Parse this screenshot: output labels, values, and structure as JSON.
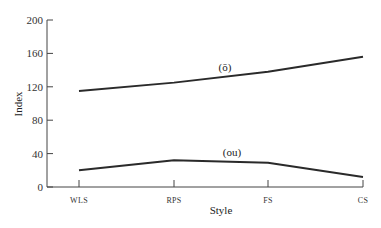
{
  "chart_data": {
    "type": "line",
    "title": "",
    "xlabel": "Style",
    "ylabel": "Index",
    "categories": [
      "WLS",
      "RPS",
      "FS",
      "CS"
    ],
    "ylim": [
      0,
      200
    ],
    "yticks": [
      0,
      40,
      80,
      120,
      160,
      200
    ],
    "grid": false,
    "legend": "none",
    "series": [
      {
        "name": "(ō)",
        "values": [
          115,
          125,
          138,
          156
        ]
      },
      {
        "name": "(ou)",
        "values": [
          20,
          32,
          29,
          12
        ]
      }
    ],
    "annotations": [
      {
        "text": "(ō)",
        "series": 0,
        "near": "between RPS and FS"
      },
      {
        "text": "(ou)",
        "series": 1,
        "near": "between RPS and FS"
      }
    ]
  }
}
